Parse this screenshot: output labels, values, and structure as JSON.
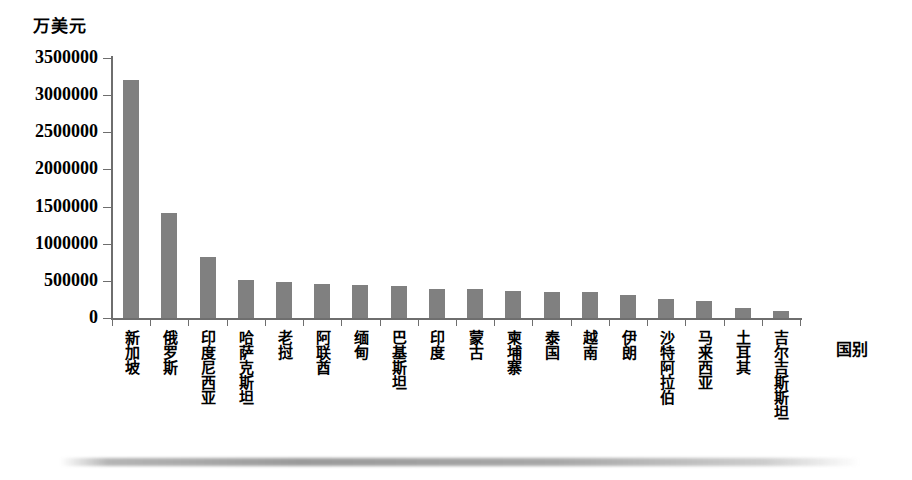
{
  "chart_data": {
    "type": "bar",
    "title": "",
    "subtitle": "",
    "ylabel": "万美元",
    "xlabel": "国别",
    "ylim": [
      0,
      3500000
    ],
    "ytick_labels": [
      "3500000",
      "3000000",
      "2500000",
      "2000000",
      "1500000",
      "1000000",
      "500000",
      "0"
    ],
    "ytick_values": [
      3500000,
      3000000,
      2500000,
      2000000,
      1500000,
      1000000,
      500000,
      0
    ],
    "grid": false,
    "legend": null,
    "bar_color": "#808080",
    "axis_color": "#6e6e6e",
    "categories": [
      "新加坡",
      "俄罗斯",
      "印度尼西亚",
      "哈萨克斯坦",
      "老挝",
      "阿联酋",
      "缅甸",
      "巴基斯坦",
      "印度",
      "蒙古",
      "柬埔寨",
      "泰国",
      "越南",
      "伊朗",
      "沙特阿拉伯",
      "马来西亚",
      "土耳其",
      "吉尔吉斯斯坦"
    ],
    "values": [
      3200000,
      1420000,
      820000,
      510000,
      480000,
      455000,
      440000,
      425000,
      390000,
      385000,
      370000,
      355000,
      350000,
      305000,
      250000,
      225000,
      130000,
      95000
    ]
  }
}
